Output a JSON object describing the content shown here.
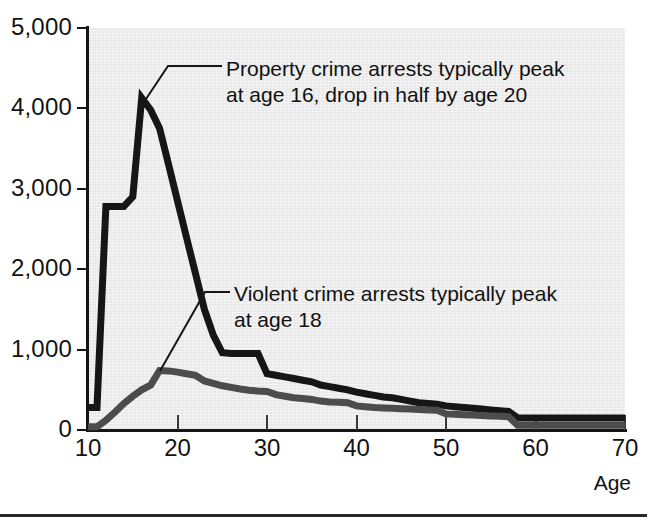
{
  "figure": {
    "x_axis_title": "Age",
    "bottom_rule": "horizontal-rule"
  },
  "axes": {
    "y_ticks": [
      "5,000",
      "4,000",
      "3,000",
      "2,000",
      "1,000",
      "0"
    ],
    "y_tick_values": [
      5000,
      4000,
      3000,
      2000,
      1000,
      0
    ],
    "x_ticks": [
      "10",
      "20",
      "30",
      "40",
      "50",
      "60",
      "70"
    ],
    "x_tick_values": [
      10,
      20,
      30,
      40,
      50,
      60,
      70
    ]
  },
  "annotations": {
    "property": "Property crime arrests typically peak\nat age 16, drop in half by age 20",
    "violent": "Violent crime arrests typically peak\nat age 18"
  },
  "colors": {
    "property_line": "#161616",
    "violent_line": "#4c4c4c",
    "plot_background": "#e9e9e9",
    "page_background": "#ffffff",
    "axis": "#151515",
    "text": "#131313"
  },
  "chart_data": {
    "type": "line",
    "title": "",
    "subtitle": "",
    "xlabel": "Age",
    "ylabel": "",
    "xlim": [
      10,
      70
    ],
    "ylim": [
      0,
      5000
    ],
    "grid": false,
    "legend": "none (series identified by callout annotations)",
    "x": [
      10,
      11,
      12,
      13,
      14,
      15,
      16,
      17,
      18,
      19,
      20,
      21,
      22,
      23,
      24,
      25,
      26,
      27,
      28,
      29,
      30,
      31,
      32,
      33,
      34,
      35,
      36,
      37,
      38,
      39,
      40,
      41,
      42,
      43,
      44,
      45,
      46,
      47,
      48,
      49,
      50,
      51,
      52,
      53,
      54,
      55,
      56,
      57,
      58,
      59,
      60,
      61,
      62,
      63,
      64,
      65,
      66,
      67,
      68,
      69,
      70
    ],
    "series": [
      {
        "name": "Property crime arrests",
        "color": "#161616",
        "values": [
          280,
          280,
          2780,
          2780,
          2780,
          2900,
          4130,
          3980,
          3750,
          3300,
          2850,
          2400,
          1950,
          1500,
          1180,
          960,
          950,
          950,
          950,
          950,
          700,
          680,
          660,
          640,
          620,
          600,
          560,
          540,
          520,
          500,
          470,
          450,
          430,
          410,
          400,
          380,
          360,
          340,
          330,
          320,
          300,
          290,
          280,
          270,
          260,
          250,
          240,
          230,
          150,
          150,
          150,
          150,
          150,
          150,
          150,
          150,
          150,
          150,
          150,
          150,
          150
        ]
      },
      {
        "name": "Violent crime arrests",
        "color": "#4c4c4c",
        "values": [
          40,
          40,
          120,
          220,
          330,
          420,
          500,
          560,
          740,
          735,
          720,
          700,
          680,
          610,
          580,
          550,
          530,
          510,
          495,
          485,
          480,
          440,
          420,
          400,
          390,
          380,
          360,
          350,
          345,
          340,
          300,
          290,
          280,
          275,
          270,
          265,
          260,
          255,
          250,
          245,
          200,
          195,
          190,
          185,
          180,
          175,
          170,
          165,
          60,
          60,
          60,
          60,
          60,
          60,
          60,
          60,
          60,
          60,
          60,
          60,
          60
        ]
      }
    ]
  }
}
